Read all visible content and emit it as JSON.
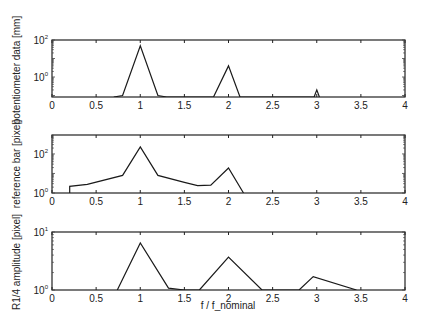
{
  "figure": {
    "xlabel": "f / f_nominal",
    "xticks": [
      "0",
      "0.5",
      "1",
      "1.5",
      "2",
      "2.5",
      "3",
      "3.5",
      "4"
    ]
  },
  "chart_data": [
    {
      "type": "line",
      "title": "",
      "xlabel": "",
      "ylabel": "potentiometer data [mm]",
      "yscale": "log",
      "xlim": [
        0,
        4
      ],
      "ylim": [
        0.083,
        100
      ],
      "xticks": [
        0,
        0.5,
        1,
        1.5,
        2,
        2.5,
        3,
        3.5,
        4
      ],
      "yticks": [
        {
          "label": "10",
          "exp": "0",
          "value": 1
        },
        {
          "label": "10",
          "exp": "2",
          "value": 100
        }
      ],
      "grid": false,
      "x": [
        0.7,
        0.8,
        1.0,
        1.2,
        1.3,
        1.83,
        2.0,
        2.13,
        2.97,
        3.0,
        3.03
      ],
      "values": [
        0.083,
        0.1,
        48,
        0.1,
        0.083,
        0.083,
        4.0,
        0.083,
        0.083,
        0.2,
        0.083
      ]
    },
    {
      "type": "line",
      "title": "",
      "xlabel": "",
      "ylabel": "reference bar [pixel]",
      "yscale": "log",
      "xlim": [
        0,
        4
      ],
      "ylim": [
        1,
        930
      ],
      "xticks": [
        0,
        0.5,
        1,
        1.5,
        2,
        2.5,
        3,
        3.5,
        4
      ],
      "yticks": [
        {
          "label": "10",
          "exp": "0",
          "value": 1
        },
        {
          "label": "10",
          "exp": "2",
          "value": 100
        }
      ],
      "grid": false,
      "x": [
        0.2,
        0.2,
        0.4,
        0.8,
        1.0,
        1.2,
        1.5,
        1.65,
        1.8,
        2.0,
        2.17
      ],
      "values": [
        1,
        2.2,
        2.8,
        8,
        230,
        8,
        3.5,
        2.4,
        2.5,
        19,
        1
      ]
    },
    {
      "type": "line",
      "title": "",
      "xlabel": "f / f_nominal",
      "ylabel": "R1/4 amplitude [pixel]",
      "yscale": "log",
      "xlim": [
        0,
        4
      ],
      "ylim": [
        1,
        10
      ],
      "xticks": [
        0,
        0.5,
        1,
        1.5,
        2,
        2.5,
        3,
        3.5,
        4
      ],
      "yticks": [
        {
          "label": "10",
          "exp": "0",
          "value": 1
        },
        {
          "label": "10",
          "exp": "1",
          "value": 10
        }
      ],
      "grid": false,
      "x": [
        0.74,
        1.0,
        1.32,
        1.5,
        1.67,
        2.0,
        2.38,
        2.8,
        2.96,
        3.45
      ],
      "values": [
        1,
        6.5,
        1.08,
        1.0,
        1,
        3.7,
        1,
        1,
        1.7,
        1
      ]
    }
  ]
}
